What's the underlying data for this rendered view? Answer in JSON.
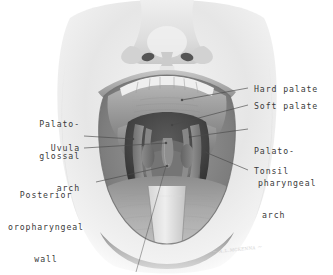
{
  "figure": {
    "style": "grayscale medical illustration",
    "background_color": "#ffffff",
    "ink_color": "#3a3a3a",
    "signature": "artist signature"
  },
  "labels": {
    "hard_palate": "Hard palate",
    "soft_palate": "Soft palate",
    "palato_pharyngeal_l1": "Palato-",
    "palato_pharyngeal_l2": "pharyngeal",
    "palato_pharyngeal_l3": "arch",
    "tonsil": "Tonsil",
    "palato_glossal_l1": "Palato-",
    "palato_glossal_l2": "glossal",
    "palato_glossal_l3": "arch",
    "uvula": "Uvula",
    "posterior_wall_l1": "Posterior",
    "posterior_wall_l2": "oropharyngeal",
    "posterior_wall_l3": "wall"
  },
  "anatomy_parts": {
    "nose": "nose",
    "upper_lip": "upper lip",
    "lower_lip": "lower lip",
    "upper_teeth": "upper teeth",
    "hard_palate": "hard palate",
    "soft_palate": "soft palate",
    "uvula": "uvula",
    "palatoglossal_arch": "palatoglossal arch",
    "palatopharyngeal_arch": "palatopharyngeal arch",
    "tonsil": "palatine tonsil",
    "posterior_pharyngeal_wall": "posterior oropharyngeal wall",
    "tongue": "tongue",
    "tongue_depressor": "tongue depressor"
  }
}
